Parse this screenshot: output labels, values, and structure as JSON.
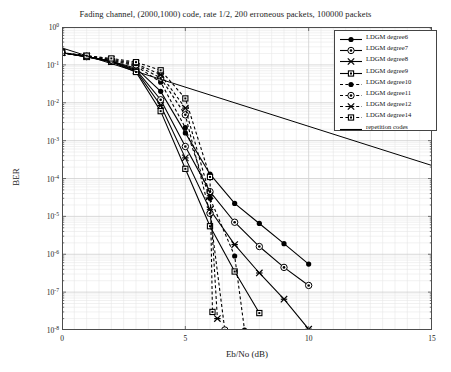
{
  "chart_data": {
    "type": "line",
    "title": "Fading channel, (2000,1000) code, rate 1/2, 200 erroneous packets, 100000 packets",
    "xlabel": "Eb/No (dB)",
    "ylabel": "BER",
    "xlim": [
      0,
      15
    ],
    "ylim": [
      1e-08,
      1
    ],
    "xticks": [
      "0",
      "5",
      "10",
      "15"
    ],
    "xtick_values": [
      0,
      5,
      10,
      15
    ],
    "ytick_labels": [
      "10^0",
      "10^-1",
      "10^-2",
      "10^-3",
      "10^-4",
      "10^-5",
      "10^-6",
      "10^-7",
      "10^-8"
    ],
    "ytick_exponents": [
      0,
      -1,
      -2,
      -3,
      -4,
      -5,
      -6,
      -7,
      -8
    ],
    "yscale": "log",
    "grid": true,
    "legend_position": "upper right",
    "series": [
      {
        "name": "LDGM degree6",
        "marker": "filled-circle",
        "linestyle": "solid",
        "x": [
          0,
          1,
          2,
          3,
          4,
          5,
          6,
          7,
          8,
          9,
          10
        ],
        "y": [
          0.21,
          0.165,
          0.125,
          0.082,
          0.02,
          0.0016,
          0.00013,
          2.2e-05,
          6.5e-06,
          1.9e-06,
          5.5e-07
        ]
      },
      {
        "name": "LDGM degree7",
        "marker": "circle-dot",
        "linestyle": "solid",
        "x": [
          0,
          1,
          2,
          3,
          4,
          5,
          6,
          7,
          8,
          9,
          10
        ],
        "y": [
          0.21,
          0.165,
          0.125,
          0.075,
          0.012,
          0.0007,
          4.5e-05,
          7e-06,
          1.6e-06,
          4.5e-07,
          1.5e-07
        ]
      },
      {
        "name": "LDGM degree8",
        "marker": "star-x",
        "linestyle": "solid",
        "x": [
          0,
          1,
          2,
          3,
          4,
          5,
          6,
          7,
          8,
          9,
          10
        ],
        "y": [
          0.21,
          0.165,
          0.122,
          0.07,
          0.0085,
          0.00035,
          1.5e-05,
          1.8e-06,
          3.2e-07,
          6.5e-08,
          1.05e-08
        ]
      },
      {
        "name": "LDGM degree9",
        "marker": "open-square",
        "linestyle": "solid",
        "x": [
          0,
          1,
          2,
          3,
          4,
          5,
          6,
          7,
          8
        ],
        "y": [
          0.21,
          0.162,
          0.12,
          0.065,
          0.006,
          0.00018,
          5.5e-06,
          3.5e-07,
          2.8e-08
        ]
      },
      {
        "name": "LDGM degree10",
        "marker": "filled-circle",
        "linestyle": "dashed",
        "x": [
          0,
          1,
          2,
          3,
          4,
          5,
          6,
          7,
          7.4
        ],
        "y": [
          0.21,
          0.168,
          0.13,
          0.093,
          0.035,
          0.0022,
          3e-05,
          9e-07,
          1e-08
        ]
      },
      {
        "name": "LDGM degree11",
        "marker": "circle-dot",
        "linestyle": "dashed",
        "x": [
          0,
          1,
          2,
          3,
          4,
          5,
          6,
          6.6
        ],
        "y": [
          0.21,
          0.17,
          0.135,
          0.1,
          0.045,
          0.0048,
          1.2e-05,
          1e-08
        ]
      },
      {
        "name": "LDGM degree12",
        "marker": "star-x",
        "linestyle": "dashed",
        "x": [
          0,
          1,
          2,
          3,
          4,
          5,
          6,
          6.3
        ],
        "y": [
          0.21,
          0.172,
          0.14,
          0.108,
          0.055,
          0.0072,
          3.5e-05,
          2e-08
        ]
      },
      {
        "name": "LDGM degree14",
        "marker": "open-square",
        "linestyle": "dashed",
        "x": [
          0,
          1,
          2,
          3,
          4,
          5,
          6,
          6.1
        ],
        "y": [
          0.21,
          0.175,
          0.148,
          0.118,
          0.072,
          0.013,
          0.00011,
          3e-08
        ]
      },
      {
        "name": "repetition codes",
        "marker": "none",
        "linestyle": "solid",
        "x": [
          0,
          15
        ],
        "y": [
          0.28,
          0.00022
        ]
      }
    ]
  },
  "legend": {
    "items": [
      {
        "label": "LDGM degree6"
      },
      {
        "label": "LDGM degree7"
      },
      {
        "label": "LDGM degree8"
      },
      {
        "label": "LDGM degree9"
      },
      {
        "label": "LDGM degree10"
      },
      {
        "label": "LDGM degree11"
      },
      {
        "label": "LDGM degree12"
      },
      {
        "label": "LDGM degree14"
      },
      {
        "label": "repetition codes"
      }
    ]
  },
  "colors": {
    "line": "#000000",
    "axis": "#4d4d4d",
    "grid_major": "#cfcfcf",
    "grid_minor": "#e8e8e8",
    "background": "#ffffff"
  }
}
